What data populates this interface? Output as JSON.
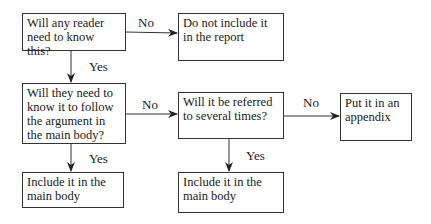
{
  "flowchart": {
    "nodes": {
      "q1": {
        "text": "Will any reader need to know this?"
      },
      "exclude": {
        "text": "Do not include it in the report"
      },
      "q2": {
        "text": "Will they need to know it to follow the argument in the main body?"
      },
      "q3": {
        "text": "Will it be referred to several times?"
      },
      "appendix": {
        "text": "Put it in an appendix"
      },
      "main_body_1": {
        "text": "Include it in the main body"
      },
      "main_body_2": {
        "text": "Include it in the main body"
      }
    },
    "edges": {
      "q1_no": {
        "from": "q1",
        "to": "exclude",
        "label": "No"
      },
      "q1_yes": {
        "from": "q1",
        "to": "q2",
        "label": "Yes"
      },
      "q2_no": {
        "from": "q2",
        "to": "q3",
        "label": "No"
      },
      "q2_yes": {
        "from": "q2",
        "to": "main_body_1",
        "label": "Yes"
      },
      "q3_no": {
        "from": "q3",
        "to": "appendix",
        "label": "No"
      },
      "q3_yes": {
        "from": "q3",
        "to": "main_body_2",
        "label": "Yes"
      }
    }
  }
}
